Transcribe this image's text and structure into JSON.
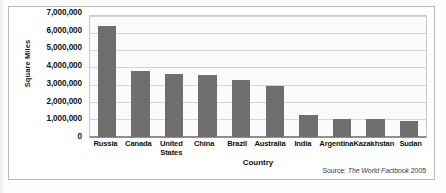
{
  "figure": {
    "source_label": "Source:",
    "source_work": "The World Factbook",
    "source_year": "2005"
  },
  "chart_data": {
    "type": "bar",
    "title": "",
    "xlabel": "Country",
    "ylabel": "Square Miles",
    "categories": [
      "Russia",
      "Canada",
      "United States",
      "China",
      "Brazil",
      "Australia",
      "India",
      "Argentina",
      "Kazakhstan",
      "Sudan"
    ],
    "values": [
      6500000,
      3850000,
      3700000,
      3600000,
      3300000,
      2970000,
      1270000,
      1070000,
      1050000,
      960000
    ],
    "ylim": [
      0,
      7000000
    ],
    "ytick_values": [
      0,
      1000000,
      2000000,
      3000000,
      4000000,
      5000000,
      6000000,
      7000000
    ],
    "ytick_labels": [
      "0",
      "1,000,000",
      "2,000,000",
      "3,000,000",
      "4,000,000",
      "5,000,000",
      "6,000,000",
      "7,000,000"
    ],
    "grid": true,
    "legend": "none",
    "bar_color": "#706f6f",
    "plot_background": "#fbfbfb",
    "gridline_color": "#d6d6d6"
  }
}
